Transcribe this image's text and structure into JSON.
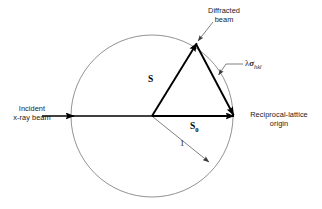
{
  "figure": {
    "background_color": "#ffffff",
    "line_color": "#000000",
    "circle_color": "#6e6e6e",
    "leader_color": "#5a5a5a",
    "width": 322,
    "height": 209
  },
  "geometry": {
    "circle": {
      "cx": 152,
      "cy": 116,
      "r": 81,
      "stroke_width": 0.7
    },
    "incident_axis": {
      "x1": 62,
      "y1": 116,
      "x2": 233,
      "y2": 116
    },
    "triangle": {
      "center_vertex": {
        "x": 152,
        "y": 116
      },
      "apex_vertex": {
        "x": 196,
        "y": 44
      },
      "right_vertex": {
        "x": 233,
        "y": 116
      }
    },
    "radius_arrow": {
      "x1": 152,
      "y1": 116,
      "x2": 208,
      "y2": 161
    }
  },
  "labels": {
    "diffracted_beam": {
      "line1": "Diffracted",
      "line2": "beam"
    },
    "incident_beam": {
      "line1": "Incident",
      "line2": "x-ray beam"
    },
    "reciprocal_origin": {
      "line1": "Reciprocal-lattice",
      "line2": "origin"
    },
    "vector_s": "S",
    "vector_s0_base": "S",
    "vector_s0_sub": "0",
    "radius": "1",
    "sigma_lambda": "λ",
    "sigma_symbol": "σ",
    "sigma_subscript": "hkl"
  },
  "annotations": {
    "leaders": [
      {
        "name": "diffracted-beam-leader",
        "from_text": "Diffracted beam",
        "to_point": "apex-vertex"
      },
      {
        "name": "sigma-leader",
        "from_text": "lambda sigma hkl",
        "to_point": "right-edge-of-triangle"
      },
      {
        "name": "radius-leader",
        "from_text": "1",
        "to_point": "circle-edge"
      }
    ]
  }
}
